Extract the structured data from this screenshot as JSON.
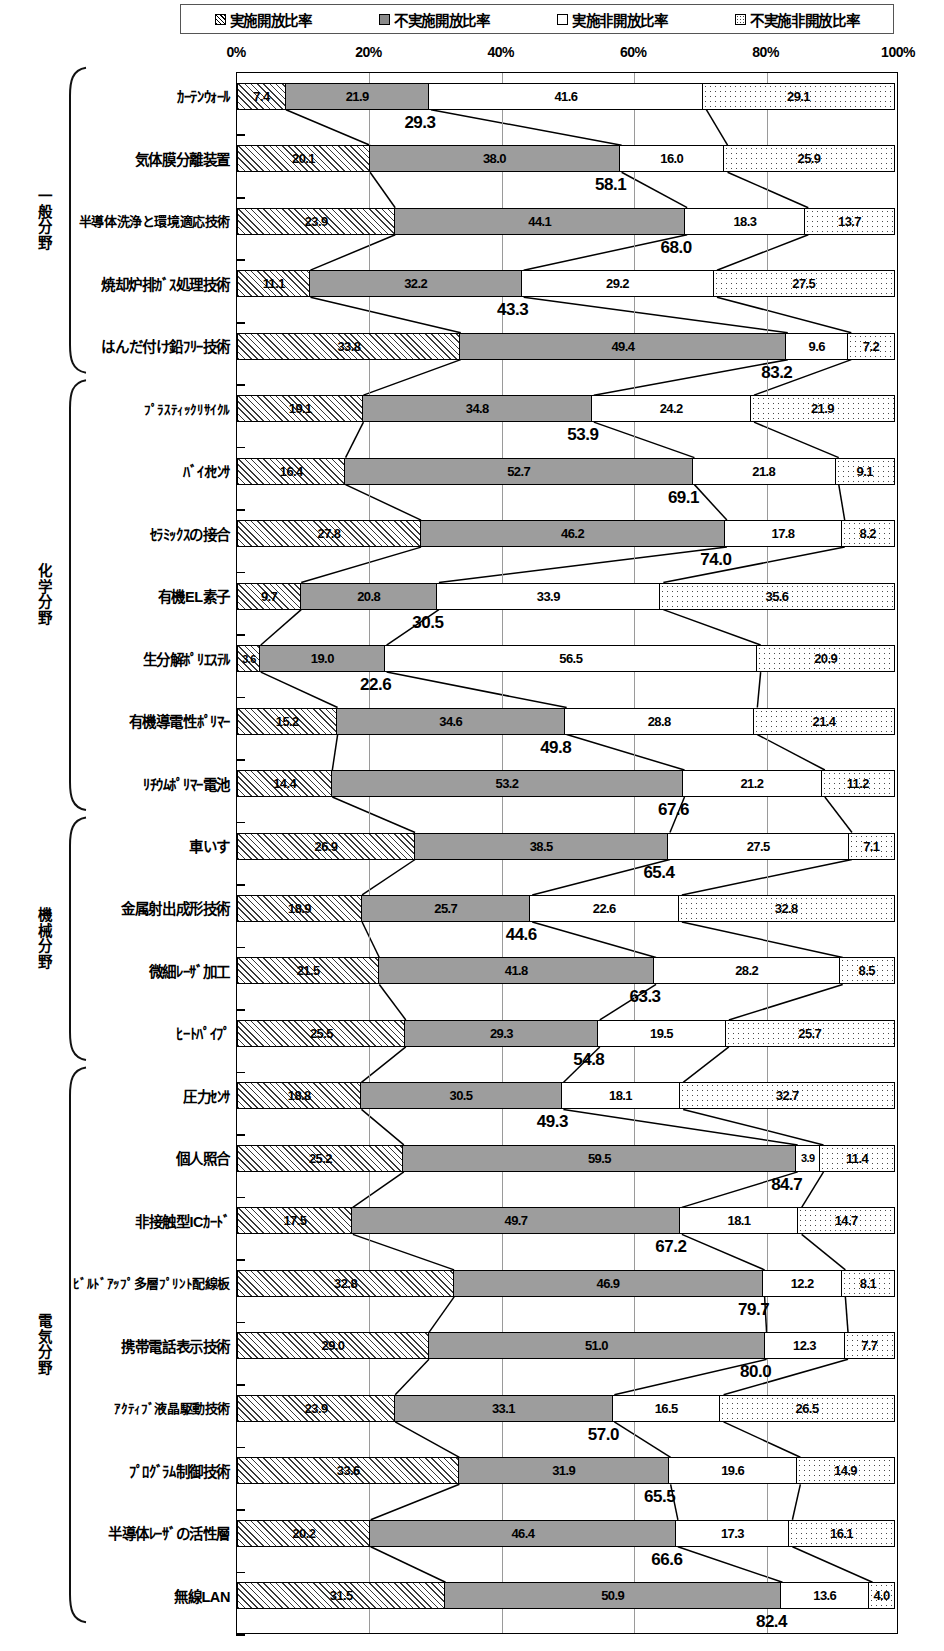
{
  "legend": {
    "items": [
      {
        "label": "実施開放比率",
        "pattern": "hatch",
        "icon": "hatched-square-icon"
      },
      {
        "label": "不実施開放比率",
        "pattern": "solid",
        "icon": "gray-square-icon"
      },
      {
        "label": "実施非開放比率",
        "pattern": "white",
        "icon": "white-square-icon"
      },
      {
        "label": "不実施非開放比率",
        "pattern": "dots",
        "icon": "dotted-square-icon"
      }
    ]
  },
  "axis": {
    "ticks": [
      "0%",
      "20%",
      "40%",
      "60%",
      "80%",
      "100%"
    ],
    "tick_values": [
      0,
      20,
      40,
      60,
      80,
      100
    ]
  },
  "groups": [
    {
      "name": "一般分野",
      "start": 0,
      "count": 5
    },
    {
      "name": "化学分野",
      "start": 5,
      "count": 7
    },
    {
      "name": "機械分野",
      "start": 12,
      "count": 4
    },
    {
      "name": "電気分野",
      "start": 16,
      "count": 9
    }
  ],
  "chart_data": {
    "type": "bar",
    "orientation": "horizontal",
    "stacked": true,
    "title": "",
    "xlabel": "",
    "ylabel": "",
    "xlim": [
      0,
      100
    ],
    "grid": true,
    "legend_position": "top",
    "series": [
      {
        "name": "実施開放比率",
        "values": [
          7.4,
          20.1,
          23.9,
          11.1,
          33.8,
          19.1,
          16.4,
          27.8,
          9.7,
          3.6,
          15.2,
          14.4,
          26.9,
          18.9,
          21.5,
          25.5,
          18.8,
          25.2,
          17.5,
          32.8,
          29.0,
          23.9,
          33.6,
          20.2,
          31.5
        ]
      },
      {
        "name": "不実施開放比率",
        "values": [
          21.9,
          38.0,
          44.1,
          32.2,
          49.4,
          34.8,
          52.7,
          46.2,
          20.8,
          19.0,
          34.6,
          53.2,
          38.5,
          25.7,
          41.8,
          29.3,
          30.5,
          59.5,
          49.7,
          46.9,
          51.0,
          33.1,
          31.9,
          46.4,
          50.9
        ]
      },
      {
        "name": "実施非開放比率",
        "values": [
          41.6,
          16.0,
          18.3,
          29.2,
          9.6,
          24.2,
          21.8,
          17.8,
          33.9,
          56.5,
          28.8,
          21.2,
          27.5,
          22.6,
          28.2,
          19.5,
          18.1,
          3.9,
          18.1,
          12.2,
          12.3,
          16.5,
          19.6,
          17.3,
          13.6
        ]
      },
      {
        "name": "不実施非開放比率",
        "values": [
          29.1,
          25.9,
          13.7,
          27.5,
          7.2,
          21.9,
          9.1,
          8.2,
          35.6,
          20.9,
          21.4,
          11.2,
          7.1,
          32.8,
          8.5,
          25.7,
          32.7,
          11.4,
          14.7,
          8.1,
          7.7,
          26.5,
          14.9,
          16.1,
          4.0
        ]
      }
    ],
    "categories": [
      "ｶｰﾃﾝｳｫｰﾙ",
      "気体膜分離装置",
      "半導体洗浄と環境適応技術",
      "焼却炉排ｶﾞｽ処理技術",
      "はんだ付け鉛ﾌﾘｰ技術",
      "ﾌﾟﾗｽﾃｨｯｸﾘｻｲｸﾙ",
      "ﾊﾞｲｵｾﾝｻ",
      "ｾﾗﾐｯｸｽの接合",
      "有機EL素子",
      "生分解ﾎﾟﾘｴｽﾃﾙ",
      "有機導電性ﾎﾟﾘﾏｰ",
      "ﾘﾁｳﾑﾎﾟﾘﾏｰ電池",
      "車いす",
      "金属射出成形技術",
      "微細ﾚｰｻﾞ加工",
      "ﾋｰﾄﾊﾟｲﾌﾟ",
      "圧力ｾﾝｻ",
      "個人照合",
      "非接触型ICｶｰﾄﾞ",
      "ﾋﾞﾙﾄﾞｱｯﾌﾟ多層ﾌﾟﾘﾝﾄ配線板",
      "携帯電話表示技術",
      "ｱｸﾃｨﾌﾞ液晶駆動技術",
      "ﾌﾟﾛｸﾞﾗﾑ制御技術",
      "半導体ﾚｰｻﾞの活性層",
      "無線LAN"
    ],
    "cumulative_labels": [
      29.3,
      58.1,
      68.0,
      43.3,
      83.2,
      53.9,
      69.1,
      74.0,
      30.5,
      22.6,
      49.8,
      67.6,
      65.4,
      44.6,
      63.3,
      54.8,
      49.3,
      84.7,
      67.2,
      79.7,
      80.0,
      57.0,
      65.5,
      66.6,
      82.4
    ],
    "cumulative_note": "sum of 実施開放比率 + 不実施開放比率"
  },
  "colors": {
    "series_1": "#3a3a3a",
    "series_2": "#9d9d9d",
    "series_3": "#ffffff",
    "series_4": "#ffffff",
    "border": "#000000",
    "grid": "#9a9a9a"
  }
}
